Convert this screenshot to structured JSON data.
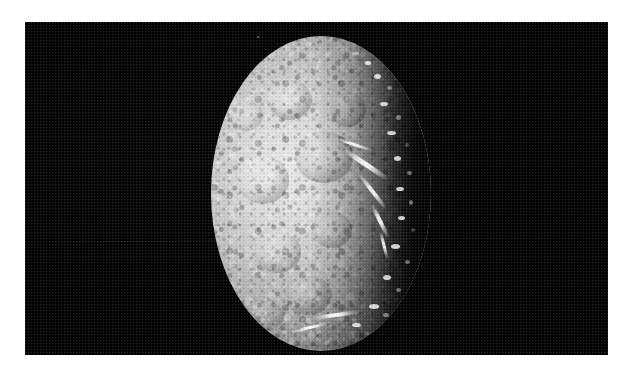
{
  "image": {
    "kind": "spacecraft-photograph",
    "subject": "icy moon crescent",
    "caption": "",
    "border_color": "#ffffff",
    "space_color": "#000000",
    "surface_highlight_color": "#e9e9e9",
    "surface_midtone_color": "#a8a8a8",
    "terminator_shadow_color": "#050505",
    "frame": {
      "left": 25,
      "top": 22,
      "width": 583,
      "height": 333
    },
    "disk": {
      "left": 211,
      "top": 36,
      "width": 220,
      "height": 315,
      "illumination": "lit from left, terminator on right"
    },
    "artifacts": [
      {
        "name": "film-scratch",
        "type": "horizontal line",
        "y": 242
      },
      {
        "name": "dust-speck",
        "type": "point",
        "x": 257,
        "y": 36
      }
    ],
    "features": [
      {
        "name": "bright-limb",
        "description": "illuminated limb along upper-left edge"
      },
      {
        "name": "chasma-system",
        "description": "bright branching canyon streaks near terminator"
      },
      {
        "name": "crater-field",
        "description": "heavily cratered mottled terrain"
      },
      {
        "name": "terminator-ridges",
        "description": "jagged sunlit peaks along day-night boundary"
      }
    ]
  },
  "overlay": {
    "title": "",
    "status": ""
  }
}
